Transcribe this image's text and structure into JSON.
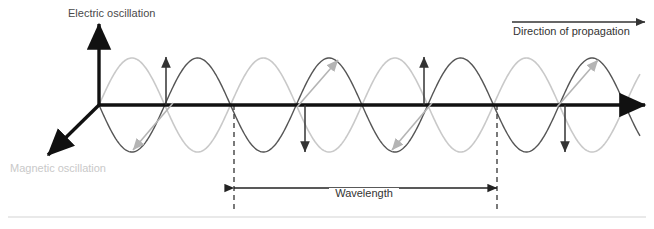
{
  "diagram": {
    "title_visible": false,
    "background_color": "#ffffff",
    "labels": {
      "electric": "Electric oscillation",
      "magnetic": "Magnetic oscillation",
      "propagation": "Direction of propagation",
      "wavelength": "Wavelength"
    },
    "colors": {
      "axis": "#111111",
      "electric_wave": "#c9c9c9",
      "magnetic_wave": "#555555",
      "electric_label_text": "#4a4a4a",
      "magnetic_label_text": "#c9c9c9",
      "arrow_dark": "#333333",
      "arrow_gray": "#b4b4b4",
      "dashed_guide": "#333333",
      "separator": "#e2e2e2"
    }
  },
  "chart_data": {
    "type": "line",
    "xlabel": "Direction of propagation",
    "ylabel": "Electric oscillation",
    "grid": false,
    "legend": false,
    "axis_origin": {
      "x": 99,
      "y": 105
    },
    "axes": [
      {
        "name": "electric-axis",
        "label": "Electric oscillation",
        "from": [
          99,
          105
        ],
        "to": [
          99,
          24
        ],
        "color": "#111111"
      },
      {
        "name": "propagation-axis",
        "label": "Direction of propagation",
        "from": [
          99,
          105
        ],
        "to": [
          645,
          105
        ],
        "color": "#111111"
      },
      {
        "name": "magnetic-axis",
        "label": "Magnetic oscillation",
        "from": [
          99,
          105
        ],
        "to": [
          48,
          155
        ],
        "color": "#111111"
      }
    ],
    "wave_geometry": {
      "x_start": 99,
      "x_end": 640,
      "baseline_y": 105,
      "amplitude_px": 47,
      "period_px": 131.5,
      "cycles": 4.1
    },
    "series": [
      {
        "name": "Electric oscillation",
        "color": "#c9c9c9",
        "phase": "sine",
        "amplitude": 47,
        "description": "light gray sinusoid, positive first half-cycle"
      },
      {
        "name": "Magnetic oscillation",
        "color": "#555555",
        "phase": "negative-sine",
        "amplitude": 47,
        "description": "dark gray dashed-look sinusoid, inverted relative to electric"
      }
    ],
    "field_arrows": [
      {
        "kind": "electric",
        "direction": "up",
        "x": 166,
        "y_from": 105,
        "y_to": 57,
        "color": "#333333"
      },
      {
        "kind": "electric",
        "direction": "down",
        "x": 305,
        "y_from": 105,
        "y_to": 152,
        "color": "#333333"
      },
      {
        "kind": "electric",
        "direction": "up",
        "x": 424,
        "y_from": 105,
        "y_to": 57,
        "color": "#333333"
      },
      {
        "kind": "electric",
        "direction": "down",
        "x": 565,
        "y_from": 105,
        "y_to": 152,
        "color": "#333333"
      },
      {
        "kind": "magnetic",
        "direction": "down-left",
        "from": [
          173,
          103
        ],
        "to": [
          133,
          150
        ],
        "color": "#b4b4b4"
      },
      {
        "kind": "magnetic",
        "direction": "up-right",
        "from": [
          297,
          107
        ],
        "to": [
          338,
          60
        ],
        "color": "#b4b4b4"
      },
      {
        "kind": "magnetic",
        "direction": "down-left",
        "from": [
          432,
          103
        ],
        "to": [
          392,
          150
        ],
        "color": "#b4b4b4"
      },
      {
        "kind": "magnetic",
        "direction": "up-right",
        "from": [
          557,
          107
        ],
        "to": [
          598,
          60
        ],
        "color": "#b4b4b4"
      }
    ],
    "guides": [
      {
        "name": "wavelength-start",
        "x": 234,
        "y_from": 105,
        "y_to": 212,
        "style": "dashed"
      },
      {
        "name": "wavelength-end",
        "x": 497,
        "y_from": 105,
        "y_to": 212,
        "style": "dashed"
      }
    ],
    "measure": {
      "label": "Wavelength",
      "x_from": 234,
      "x_to": 497,
      "y": 188,
      "span_px": 263
    },
    "propagation_arrow": {
      "x_from": 512,
      "x_to": 645,
      "y": 22
    },
    "separator_line": {
      "y": 217,
      "x_from": 8,
      "x_to": 646
    }
  }
}
